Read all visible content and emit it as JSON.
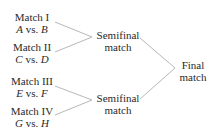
{
  "diagram": {
    "type": "tournament-bracket",
    "line_color": "#b8b8b8",
    "matches": [
      {
        "title": "Match I",
        "teams": {
          "a": "A",
          "vs": "vs.",
          "b": "B"
        }
      },
      {
        "title": "Match II",
        "teams": {
          "a": "C",
          "vs": "vs.",
          "b": "D"
        }
      },
      {
        "title": "Match III",
        "teams": {
          "a": "E",
          "vs": "vs.",
          "b": "F"
        }
      },
      {
        "title": "Match IV",
        "teams": {
          "a": "G",
          "vs": "vs.",
          "b": "H"
        }
      }
    ],
    "semifinals": [
      {
        "line1": "Semifinal",
        "line2": "match"
      },
      {
        "line1": "Semifinal",
        "line2": "match"
      }
    ],
    "final": {
      "line1": "Final",
      "line2": "match"
    }
  }
}
